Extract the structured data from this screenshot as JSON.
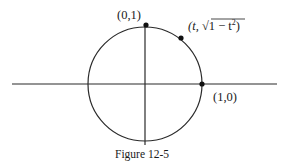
{
  "figure": {
    "caption": "Figure 12-5",
    "colors": {
      "stroke": "#2a2a2a",
      "point": "#111111",
      "text": "#1a1a1a",
      "background": "#ffffff"
    },
    "axes": {
      "horizontal": {
        "x1": 12,
        "x2": 277,
        "y": 84
      },
      "vertical": {
        "x": 145,
        "y1": 25,
        "y2": 145
      }
    },
    "circle": {
      "cx": 145,
      "cy": 84,
      "r": 57,
      "label": "unit circle"
    },
    "points": [
      {
        "id": "top",
        "label": "(0,1)",
        "px": 146,
        "py": 25
      },
      {
        "id": "param",
        "label_prefix": "(t, ",
        "label_radicand": "1 − t",
        "label_exp": "2",
        "label_suffix": ")",
        "px": 181,
        "py": 38
      },
      {
        "id": "right",
        "label": "(1,0)",
        "px": 202,
        "py": 84
      }
    ]
  }
}
